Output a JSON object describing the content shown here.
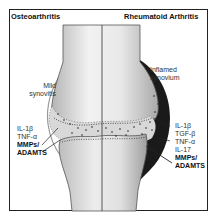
{
  "diagram": {
    "titles": {
      "left": "Osteoarthritis",
      "right": "Rheumatoid Arthritis"
    },
    "left_side": {
      "synovium_label_line1": "Mild",
      "synovium_label_line2": "synovitis",
      "mediators": [
        {
          "text": "IL-1β",
          "emphasis": false
        },
        {
          "text": "TNF-α",
          "emphasis": false
        },
        {
          "text": "MMPs/",
          "emphasis": true
        },
        {
          "text": "ADAMTS",
          "emphasis": true
        }
      ]
    },
    "right_side": {
      "synovium_label_line1": "Inflamed",
      "synovium_label_line2": "synovium",
      "mediators": [
        {
          "text": "IL-1β",
          "emphasis": false
        },
        {
          "text": "TGF-β",
          "emphasis": false
        },
        {
          "text": "TNF-α",
          "emphasis": false
        },
        {
          "text": "IL-17",
          "emphasis": false
        },
        {
          "text": "MMPs/",
          "emphasis": true
        },
        {
          "text": "ADAMTS",
          "emphasis": true
        }
      ]
    },
    "colors": {
      "bone_light": "#f4f4f4",
      "bone_dark": "#b8b8b8",
      "cartilage": "#d4d4d4",
      "synovium_inflamed": "#1a1a1a",
      "border": "#222222"
    }
  }
}
